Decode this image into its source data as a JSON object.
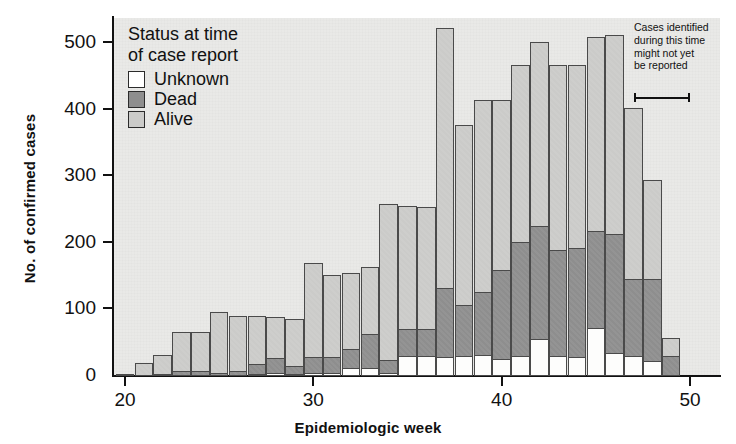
{
  "axes": {
    "ylabel": "No. of confirmed cases",
    "xlabel": "Epidemiologic week",
    "yticks": [
      0,
      100,
      200,
      300,
      400,
      500
    ],
    "xticks": [
      20,
      30,
      40,
      50
    ]
  },
  "legend": {
    "title_line1": "Status at time",
    "title_line2": "of case report",
    "items": [
      {
        "label": "Unknown",
        "color": "#ffffff",
        "swatch": "sw-unknown"
      },
      {
        "label": "Dead",
        "color": "#8e8e8e",
        "swatch": "sw-dead"
      },
      {
        "label": "Alive",
        "color": "#cbcbc9",
        "swatch": "sw-alive"
      }
    ]
  },
  "annotation": {
    "line1": "Cases identified",
    "line2": "during this time",
    "line3": "might not yet",
    "line4": "be reported",
    "bracket_start_week": 47,
    "bracket_end_week": 50
  },
  "chart_data": {
    "type": "bar",
    "stacked": true,
    "title": "",
    "xlabel": "Epidemiologic week",
    "ylabel": "No. of confirmed cases",
    "xlim": [
      19.5,
      50.5
    ],
    "ylim": [
      0,
      530
    ],
    "grid": false,
    "legend_position": "top-left inside plot",
    "categories": [
      20,
      21,
      22,
      23,
      24,
      25,
      26,
      27,
      28,
      29,
      30,
      31,
      32,
      33,
      34,
      35,
      36,
      37,
      38,
      39,
      40,
      41,
      42,
      43,
      44,
      45,
      46,
      47,
      48,
      49
    ],
    "series": [
      {
        "name": "Unknown",
        "color": "#ffffff",
        "values": [
          0,
          0,
          0,
          0,
          0,
          0,
          0,
          2,
          5,
          3,
          5,
          5,
          12,
          12,
          4,
          30,
          30,
          28,
          30,
          32,
          25,
          30,
          55,
          30,
          28,
          72,
          35,
          30,
          22,
          0
        ]
      },
      {
        "name": "Dead",
        "color": "#8e8e8e",
        "values": [
          0,
          0,
          3,
          8,
          8,
          5,
          7,
          16,
          23,
          14,
          25,
          25,
          30,
          52,
          22,
          42,
          42,
          105,
          78,
          95,
          135,
          172,
          172,
          160,
          165,
          148,
          180,
          117,
          125,
          30
        ]
      },
      {
        "name": "Alive",
        "color": "#cbcbc9",
        "values": [
          2,
          20,
          30,
          60,
          60,
          93,
          85,
          74,
          64,
          71,
          143,
          125,
          115,
          102,
          236,
          186,
          185,
          392,
          272,
          290,
          258,
          268,
          278,
          280,
          277,
          292,
          300,
          258,
          150,
          28
        ]
      }
    ],
    "totals": [
      2,
      20,
      33,
      68,
      68,
      98,
      92,
      92,
      92,
      88,
      173,
      155,
      157,
      166,
      262,
      258,
      257,
      525,
      380,
      417,
      418,
      470,
      505,
      470,
      470,
      512,
      515,
      405,
      297,
      58
    ]
  }
}
